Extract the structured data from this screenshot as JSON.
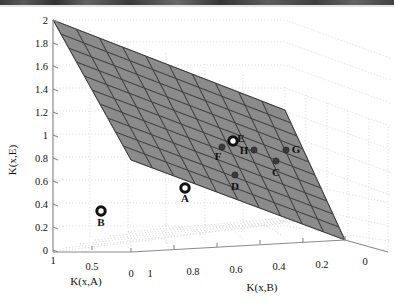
{
  "figure": {
    "type": "3d-surface-scatter",
    "background": "#ffffff",
    "plane_fill": "#8c8c8c",
    "plane_mesh_color": "#4a4a4a",
    "grid_color": "#cccccc",
    "axis_color": "#8a8a8a"
  },
  "axes": {
    "z": {
      "label": "K(x,E)",
      "ticks": [
        "2",
        "1.8",
        "1.6",
        "1.4",
        "1.2",
        "1",
        "0.8",
        "0.6",
        "0.4",
        "0.2",
        "0"
      ],
      "range": [
        0,
        2
      ]
    },
    "x": {
      "label": "K(x,A)",
      "ticks": [
        "1",
        "0.5",
        "0"
      ],
      "range": [
        1,
        0
      ]
    },
    "y": {
      "label": "K(x,B)",
      "ticks": [
        "1",
        "0.8",
        "0.6",
        "0.4",
        "0.2",
        "0"
      ],
      "range": [
        1,
        0
      ]
    }
  },
  "chart_data": {
    "type": "scatter",
    "title": "",
    "xlabel": "K(x,A)",
    "ylabel": "K(x,B)",
    "zlabel": "K(x,E)",
    "xlim": [
      1,
      0
    ],
    "ylim": [
      1,
      0
    ],
    "zlim": [
      0,
      2
    ],
    "grid": true,
    "legend": "none",
    "surface": {
      "name": "linear-plane",
      "style": "mesh-filled",
      "fill": "#8c8c8c",
      "mesh_divisions_u": 10,
      "mesh_divisions_v": 10,
      "corners_px": [
        [
          53,
          20
        ],
        [
          285,
          110
        ],
        [
          345,
          240
        ],
        [
          131,
          160
        ]
      ]
    },
    "points": [
      {
        "label": "A",
        "marker": "open-circle",
        "on_plane": false,
        "px": [
          185,
          188
        ],
        "label_px": [
          185,
          202
        ],
        "K_xA": 0.62,
        "K_xB": 0.8,
        "K_xE": 0.47
      },
      {
        "label": "B",
        "marker": "open-circle",
        "on_plane": false,
        "px": [
          101,
          211
        ],
        "label_px": [
          101,
          226
        ],
        "K_xA": 0.83,
        "K_xB": 1.0,
        "K_xE": 0.24
      },
      {
        "label": "C",
        "marker": "filled-dot",
        "on_plane": true,
        "px": [
          276,
          161
        ],
        "label_px": [
          276,
          176
        ],
        "K_xA": 0.22,
        "K_xB": 0.38,
        "K_xE": 0.66
      },
      {
        "label": "D",
        "marker": "filled-dot",
        "on_plane": true,
        "px": [
          235,
          175
        ],
        "label_px": [
          235,
          190
        ],
        "K_xA": 0.33,
        "K_xB": 0.52,
        "K_xE": 0.56
      },
      {
        "label": "E",
        "marker": "open-circle",
        "on_plane": true,
        "px": [
          233,
          141
        ],
        "label_px": [
          241,
          142
        ],
        "K_xA": 0.34,
        "K_xB": 0.5,
        "K_xE": 0.87
      },
      {
        "label": "F",
        "marker": "filled-dot",
        "on_plane": true,
        "px": [
          222,
          147
        ],
        "label_px": [
          218,
          160
        ],
        "K_xA": 0.38,
        "K_xB": 0.54,
        "K_xE": 0.8
      },
      {
        "label": "G",
        "marker": "filled-dot",
        "on_plane": true,
        "px": [
          286,
          150
        ],
        "label_px": [
          296,
          153
        ],
        "K_xA": 0.18,
        "K_xB": 0.32,
        "K_xE": 0.72
      },
      {
        "label": "H",
        "marker": "filled-dot",
        "on_plane": true,
        "px": [
          254,
          150
        ],
        "label_px": [
          244,
          154
        ],
        "K_xA": 0.27,
        "K_xB": 0.42,
        "K_xE": 0.72
      }
    ]
  }
}
